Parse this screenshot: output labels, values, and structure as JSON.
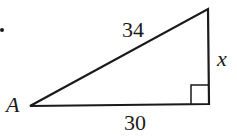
{
  "figure": {
    "type": "right-triangle",
    "stroke_color": "#1a1a1a",
    "background": "#ffffff",
    "vertices": {
      "A": {
        "x": 30,
        "y": 106
      },
      "right_angle": {
        "x": 209,
        "y": 104
      },
      "top": {
        "x": 208,
        "y": 9
      }
    },
    "labels": {
      "vertex_a": "A",
      "hypotenuse": "34",
      "base": "30",
      "vertical_side": "x"
    },
    "right_angle_marker": true,
    "bullet_marker": true
  }
}
